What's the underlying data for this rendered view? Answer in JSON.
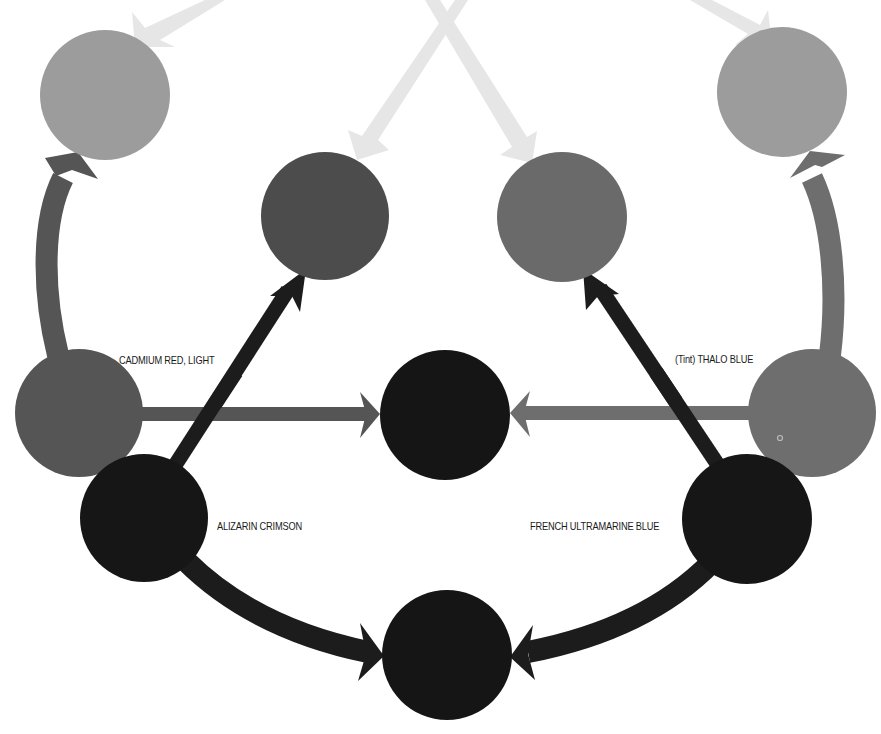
{
  "diagram": {
    "type": "color-mixing",
    "colors": {
      "light_tint": "#9c9c9c",
      "faint_arrow": "#e6e6e6",
      "cadmium_red": "#555555",
      "thalo_blue": "#6e6e6e",
      "mid_dark": "#4c4c4c",
      "mid_gray": "#6a6a6a",
      "black": "#161616",
      "black_arrow": "#1c1c1c",
      "center_black": "#151515"
    },
    "labels": {
      "cadmium_red": "CADMIUM RED, LIGHT",
      "alizarin_crimson": "ALIZARIN CRIMSON",
      "thalo_blue": "(Tint) THALO BLUE",
      "french_ultramarine": "FRENCH ULTRAMARINE BLUE"
    },
    "nodes": [
      {
        "id": "top-left-mix",
        "cx": 105,
        "cy": 95,
        "r": 65,
        "color": "light_tint"
      },
      {
        "id": "top-right-mix",
        "cx": 782,
        "cy": 92,
        "r": 65,
        "color": "light_tint"
      },
      {
        "id": "mid-left-mix",
        "cx": 325,
        "cy": 216,
        "r": 64,
        "color": "mid_dark"
      },
      {
        "id": "mid-right-mix",
        "cx": 562,
        "cy": 217,
        "r": 65,
        "color": "mid_gray"
      },
      {
        "id": "cadmium-red",
        "cx": 79,
        "cy": 413,
        "r": 64,
        "color": "cadmium_red"
      },
      {
        "id": "thalo-blue",
        "cx": 812,
        "cy": 413,
        "r": 64,
        "color": "thalo_blue"
      },
      {
        "id": "center-mix",
        "cx": 445,
        "cy": 415,
        "r": 65,
        "color": "center_black"
      },
      {
        "id": "alizarin-crimson",
        "cx": 144,
        "cy": 518,
        "r": 64,
        "color": "black"
      },
      {
        "id": "french-ultramarine",
        "cx": 747,
        "cy": 519,
        "r": 65,
        "color": "black"
      },
      {
        "id": "bottom-mix",
        "cx": 447,
        "cy": 655,
        "r": 65,
        "color": "center_black"
      }
    ]
  }
}
